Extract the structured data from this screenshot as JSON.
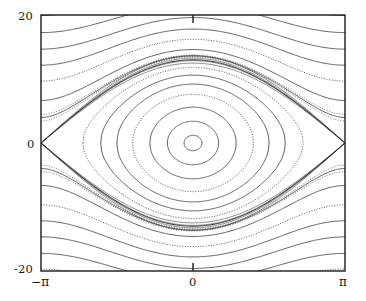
{
  "figure": {
    "name": "pendulum-phase-portrait",
    "background": "#ffffff",
    "frame_color": "#1a1a1a",
    "curve_color": "#2b2b2b"
  },
  "axes": {
    "y_top_label": "20",
    "y_zero_label": "0",
    "y_bottom_label": "-20",
    "x_left_label": "−π",
    "x_zero_label": "0",
    "x_right_label": "π"
  },
  "chart_data": {
    "type": "line",
    "title": "",
    "xlabel": "",
    "ylabel": "",
    "xlim": [
      -3.141592653589793,
      3.141592653589793
    ],
    "ylim": [
      -20,
      20
    ],
    "grid": false,
    "legend": null,
    "xticks": [
      -3.141592653589793,
      0,
      3.141592653589793
    ],
    "xticklabels": [
      "−π",
      "0",
      "π"
    ],
    "yticks": [
      -20,
      0,
      20
    ],
    "yticklabels": [
      "-20",
      "0",
      "20"
    ],
    "series": [
      {
        "name": "libration-1",
        "style": "solid",
        "level": 1.2,
        "kind": "libration"
      },
      {
        "name": "libration-2",
        "style": "solid",
        "level": 3.4,
        "kind": "libration"
      },
      {
        "name": "libration-3",
        "style": "solid",
        "level": 5.6,
        "kind": "libration"
      },
      {
        "name": "libration-4",
        "style": "dotted",
        "level": 7.6,
        "kind": "libration"
      },
      {
        "name": "libration-5",
        "style": "solid",
        "level": 9.2,
        "kind": "libration"
      },
      {
        "name": "libration-6",
        "style": "solid",
        "level": 10.6,
        "kind": "libration"
      },
      {
        "name": "libration-7",
        "style": "dotted",
        "level": 11.8,
        "kind": "libration"
      },
      {
        "name": "separatrix",
        "style": "solid",
        "level": 13.0,
        "kind": "separatrix"
      },
      {
        "name": "rotation-up-1",
        "style": "solid",
        "level": 13.6,
        "kind": "rotation"
      },
      {
        "name": "rotation-up-2",
        "style": "solid",
        "level": 14.6,
        "kind": "rotation"
      },
      {
        "name": "rotation-up-3",
        "style": "dotted",
        "level": 16.2,
        "kind": "rotation"
      },
      {
        "name": "rotation-up-4",
        "style": "solid",
        "level": 17.8,
        "kind": "rotation"
      },
      {
        "name": "rotation-up-5",
        "style": "solid",
        "level": 19.6,
        "kind": "rotation"
      },
      {
        "name": "rotation-up-6",
        "style": "solid",
        "level": 21.6,
        "kind": "rotation"
      },
      {
        "name": "rotation-up-7",
        "style": "solid",
        "level": 23.8,
        "kind": "rotation"
      },
      {
        "name": "rotation-dn-1",
        "style": "solid",
        "level": 13.6,
        "kind": "rotation"
      },
      {
        "name": "rotation-dn-2",
        "style": "solid",
        "level": 14.6,
        "kind": "rotation"
      },
      {
        "name": "rotation-dn-3",
        "style": "dotted",
        "level": 16.2,
        "kind": "rotation"
      },
      {
        "name": "rotation-dn-4",
        "style": "solid",
        "level": 17.8,
        "kind": "rotation"
      },
      {
        "name": "rotation-dn-5",
        "style": "solid",
        "level": 19.6,
        "kind": "rotation"
      },
      {
        "name": "rotation-dn-6",
        "style": "solid",
        "level": 21.6,
        "kind": "rotation"
      },
      {
        "name": "rotation-dn-7",
        "style": "dotted",
        "level": 23.6,
        "kind": "rotation"
      }
    ],
    "fixed_points": [
      {
        "name": "elliptic-center",
        "x": 0,
        "y": 0,
        "type": "O-point"
      },
      {
        "name": "hyperbolic-left",
        "x": -3.141592653589793,
        "y": 0,
        "type": "X-point"
      },
      {
        "name": "hyperbolic-right",
        "x": 3.141592653589793,
        "y": 0,
        "type": "X-point"
      }
    ]
  }
}
